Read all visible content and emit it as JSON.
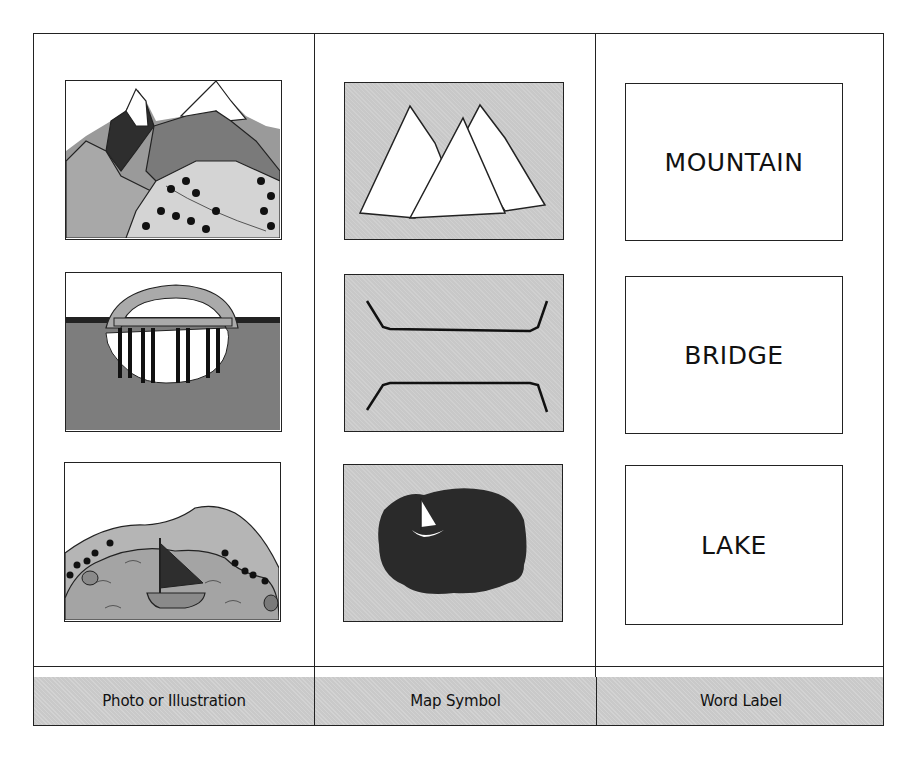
{
  "colors": {
    "outline": "#222222",
    "symbol_fill": "#c8c8c8",
    "footer_fill": "#c9c9c9",
    "dark_fill": "#2a2a2a",
    "mid_gray": "#8c8c8c",
    "light_gray": "#bdbdbd"
  },
  "columns": [
    {
      "label": "Photo or Illustration"
    },
    {
      "label": "Map Symbol"
    },
    {
      "label": "Word Label"
    }
  ],
  "rows": [
    {
      "concept": "mountain",
      "illustration": "mountain-scene-icon",
      "symbol": "mountain-peaks-symbol-icon",
      "word": "MOUNTAIN"
    },
    {
      "concept": "bridge",
      "illustration": "arch-bridge-scene-icon",
      "symbol": "bridge-symbol-icon",
      "word": "BRIDGE"
    },
    {
      "concept": "lake",
      "illustration": "lake-sailboat-scene-icon",
      "symbol": "lake-symbol-icon",
      "word": "LAKE"
    }
  ]
}
